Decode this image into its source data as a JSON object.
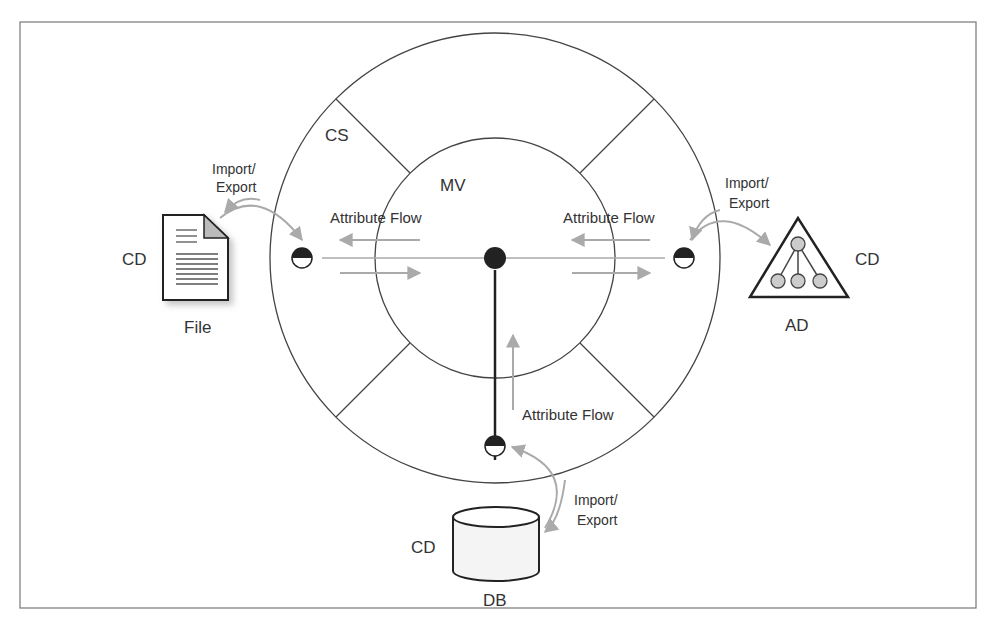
{
  "diagram": {
    "labels": {
      "cs": "CS",
      "mv": "MV",
      "flow_left": "Attribute Flow",
      "flow_right": "Attribute Flow",
      "flow_bottom": "Attribute Flow",
      "ie_left_1": "Import/",
      "ie_left_2": "Export",
      "ie_right_1": "Import/",
      "ie_right_2": "Export",
      "ie_bottom_1": "Import/",
      "ie_bottom_2": "Export",
      "cd_left": "CD",
      "cd_right": "CD",
      "cd_bottom": "CD",
      "file": "File",
      "ad": "AD",
      "db": "DB"
    },
    "colors": {
      "line": "#333333",
      "arrow": "#aaaaaa",
      "node": "#cccccc"
    }
  }
}
